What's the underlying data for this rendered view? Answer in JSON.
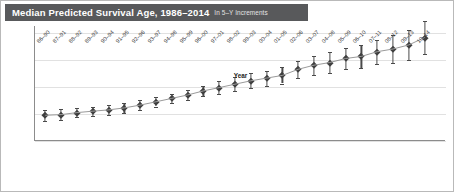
{
  "title": {
    "main": "Median Predicted Survival Age, 1986–2014",
    "sub": "In 5–Y Increments"
  },
  "chart_data": {
    "type": "line",
    "title": "Median Predicted Survival Age, 1986–2014",
    "subtitle": "In 5–Y Increments",
    "xlabel": "Year",
    "ylabel": "Median Predicted Survival Age (Years)",
    "ylim": [
      24,
      41
    ],
    "yticks": [
      24,
      28,
      32,
      36,
      40
    ],
    "grid": true,
    "legend": false,
    "marker": "diamond",
    "error_bars": "vertical",
    "categories": [
      "86–90",
      "87–91",
      "88–92",
      "89–93",
      "90–94",
      "91–95",
      "92–96",
      "93–97",
      "94–98",
      "95–99",
      "96–00",
      "97–01",
      "98–02",
      "99–03",
      "00–04",
      "01–05",
      "02–06",
      "03–07",
      "04–08",
      "05–09",
      "06–10",
      "07–11",
      "08–12",
      "09–13",
      "10–14"
    ],
    "values": [
      27.8,
      27.9,
      28.2,
      28.4,
      28.6,
      28.9,
      29.3,
      29.8,
      30.3,
      30.8,
      31.4,
      31.9,
      32.4,
      32.9,
      33.3,
      33.7,
      34.6,
      35.2,
      35.6,
      36.2,
      36.5,
      37.2,
      37.6,
      38.2,
      39.3
    ],
    "error_low": [
      27.0,
      27.1,
      27.5,
      27.7,
      27.9,
      28.2,
      28.6,
      29.1,
      29.6,
      30.0,
      30.6,
      31.0,
      31.4,
      31.8,
      32.2,
      32.5,
      33.3,
      33.8,
      34.1,
      34.6,
      34.8,
      35.4,
      35.6,
      36.0,
      36.9
    ],
    "error_high": [
      28.6,
      28.7,
      28.9,
      29.1,
      29.3,
      29.6,
      30.0,
      30.5,
      31.0,
      31.6,
      32.2,
      32.8,
      33.4,
      34.0,
      34.4,
      34.9,
      35.9,
      36.6,
      37.1,
      37.8,
      38.2,
      39.0,
      39.6,
      40.4,
      41.7
    ]
  }
}
